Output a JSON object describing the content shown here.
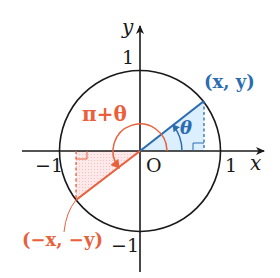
{
  "diagram": {
    "axes": {
      "x_label": "x",
      "y_label": "y",
      "origin_label": "O",
      "tick_x_pos": "1",
      "tick_x_neg": "−1",
      "tick_y_pos": "1",
      "tick_y_neg": "−1"
    },
    "angles": {
      "theta_label": "θ",
      "pi_plus_theta_label": "π+θ"
    },
    "points": {
      "p1_label": "(x, y)",
      "p2_label": "(−x, −y)"
    },
    "colors": {
      "axis": "#1a1a1a",
      "circle": "#1a1a1a",
      "blue": "#2b6cb0",
      "blue_fill": "#dcefff",
      "red": "#e8603c",
      "red_fill": "#fde3e3"
    }
  }
}
